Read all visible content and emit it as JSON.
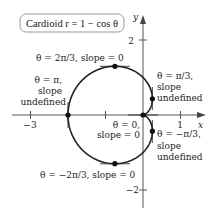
{
  "title": {
    "text": "Cardioid r = 1 − cos θ"
  },
  "axes": {
    "x_label": "x",
    "y_label": "y",
    "x_ticks": [
      {
        "value": -3,
        "label": "−3"
      },
      {
        "value": -1,
        "label": ""
      },
      {
        "value": 1,
        "label": "1"
      }
    ],
    "y_ticks": [
      {
        "value": 2,
        "label": "2"
      },
      {
        "value": -2,
        "label": "−2"
      }
    ]
  },
  "annotations": {
    "top": {
      "line1": "θ = 2π/3, slope = 0"
    },
    "left": {
      "line1": "θ = π,",
      "line2": "slope",
      "line3": "undefined"
    },
    "upper_right": {
      "line1": "θ = π/3,",
      "line2": "slope",
      "line3": "undefined"
    },
    "origin": {
      "line1": "θ = 0,",
      "line2": "slope = 0"
    },
    "lower_right": {
      "line1": "θ = −π/3,",
      "line2": "slope",
      "line3": "undefined"
    },
    "bottom": {
      "line1": "θ = −2π/3, slope = 0"
    }
  },
  "chart_data": {
    "type": "line",
    "title": "Cardioid r = 1 − cos θ",
    "equation": "r = 1 - cos(theta)",
    "xlabel": "x",
    "ylabel": "y",
    "xlim": [
      -3.3,
      1.6
    ],
    "ylim": [
      -2.5,
      2.7
    ],
    "points": [
      {
        "theta": "2π/3",
        "x": -0.75,
        "y": 1.299,
        "slope": "0"
      },
      {
        "theta": "π/3",
        "x": 0.25,
        "y": 0.433,
        "slope": "undefined"
      },
      {
        "theta": "π",
        "x": -2,
        "y": 0,
        "slope": "undefined"
      },
      {
        "theta": "0",
        "x": 0,
        "y": 0,
        "slope": "0"
      },
      {
        "theta": "-π/3",
        "x": 0.25,
        "y": -0.433,
        "slope": "undefined"
      },
      {
        "theta": "-2π/3",
        "x": -0.75,
        "y": -1.299,
        "slope": "0"
      }
    ]
  }
}
